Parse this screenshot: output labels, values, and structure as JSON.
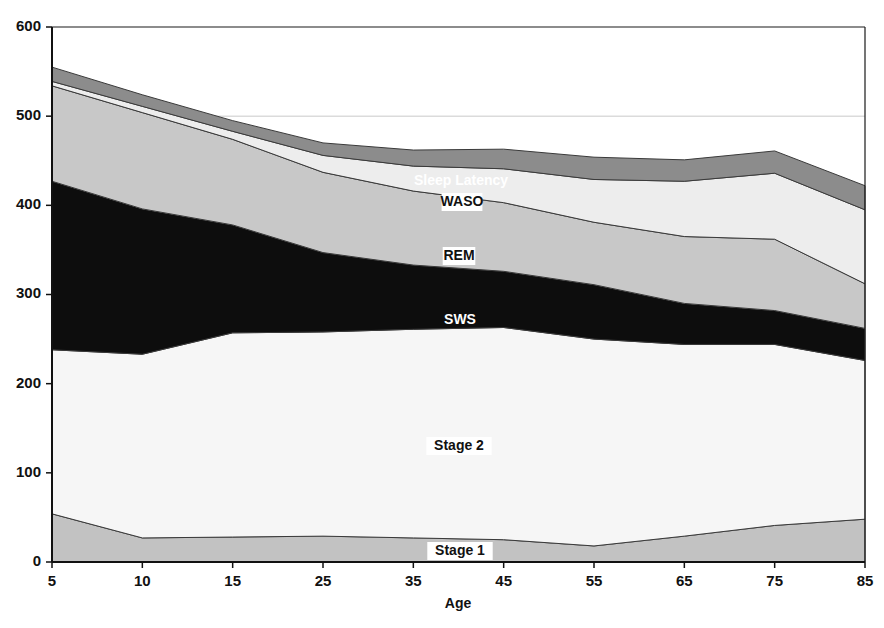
{
  "chart_data": {
    "type": "area",
    "stacked": true,
    "title": "",
    "xlabel": "Age",
    "ylabel": "",
    "categories": [
      "5",
      "10",
      "15",
      "25",
      "35",
      "45",
      "55",
      "65",
      "75",
      "85"
    ],
    "x_tick_labels": [
      "5",
      "10",
      "15",
      "25",
      "35",
      "45",
      "55",
      "65",
      "75",
      "85"
    ],
    "y_tick_labels": [
      "0",
      "100",
      "200",
      "300",
      "400",
      "500",
      "600"
    ],
    "y_ticks": [
      0,
      100,
      200,
      300,
      400,
      500,
      600
    ],
    "ylim": [
      0,
      600
    ],
    "grid": "horizontal-500-only",
    "legend_position": "inline-labels",
    "series": [
      {
        "name": "Stage 1",
        "color": "#c2c2c2",
        "values": [
          54,
          27,
          28,
          29,
          27,
          25,
          18,
          29,
          41,
          48
        ]
      },
      {
        "name": "Stage 2",
        "color": "#f6f6f6",
        "values": [
          184,
          206,
          229,
          229,
          234,
          238,
          232,
          215,
          203,
          178
        ]
      },
      {
        "name": "SWS",
        "color": "#0d0d0d",
        "values": [
          189,
          163,
          121,
          89,
          72,
          63,
          61,
          46,
          38,
          36
        ]
      },
      {
        "name": "REM",
        "color": "#c8c8c8",
        "values": [
          107,
          108,
          96,
          90,
          83,
          77,
          70,
          75,
          80,
          50
        ]
      },
      {
        "name": "WASO",
        "color": "#ededed",
        "values": [
          5,
          7,
          9,
          19,
          28,
          38,
          48,
          62,
          74,
          83
        ]
      },
      {
        "name": "Sleep Latency",
        "color": "#8c8c8c",
        "values": [
          16,
          13,
          12,
          14,
          18,
          22,
          25,
          24,
          25,
          27
        ]
      }
    ],
    "series_labels": [
      {
        "text": "Sleep Latency",
        "x_px": 461,
        "y_px": 181,
        "style": "light"
      },
      {
        "text": "WASO",
        "x_px": 462,
        "y_px": 202,
        "style": "dark"
      },
      {
        "text": "REM",
        "x_px": 459,
        "y_px": 256,
        "style": "dark"
      },
      {
        "text": "SWS",
        "x_px": 460,
        "y_px": 320,
        "style": "light"
      },
      {
        "text": "Stage 2",
        "x_px": 459,
        "y_px": 446,
        "style": "dark"
      },
      {
        "text": "Stage 1",
        "x_px": 460,
        "y_px": 551,
        "style": "dark"
      }
    ],
    "plot_geometry": {
      "left_px": 52,
      "right_px": 865,
      "top_px": 27,
      "bottom_px": 562
    },
    "colors": {
      "axis": "#1a1a1a",
      "gridline": "#c9c9c9",
      "outline": "#3a3a3a",
      "background": "#ffffff"
    }
  }
}
